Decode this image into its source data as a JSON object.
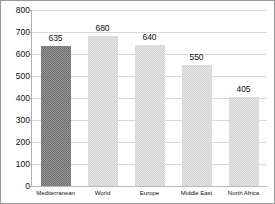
{
  "chart_data": {
    "type": "bar",
    "title": "",
    "subtitle": "",
    "xlabel": "",
    "ylabel": "",
    "categories": [
      "Mediterranean",
      "World",
      "Europe",
      "Middle East",
      "North Africa"
    ],
    "values": [
      635,
      680,
      640,
      550,
      405
    ],
    "data_labels": [
      "635",
      "680",
      "640",
      "550",
      "405"
    ],
    "ylim": [
      0,
      800
    ],
    "ytick_values": [
      800,
      700,
      600,
      500,
      400,
      300,
      200,
      100,
      0
    ],
    "ytick_labels": [
      "800",
      "700",
      "600",
      "500",
      "400",
      "300",
      "200",
      "100",
      "0"
    ],
    "grid": true,
    "grid_axis": "y",
    "legend": false,
    "legend_position": "none",
    "highlight_index": 0,
    "colors": {
      "bar_default": "#dcdcdc",
      "bar_highlight": "#808080",
      "gridline": "#d8d8d8",
      "axis": "#b0b0b0",
      "frame_border": "#9a9a9a",
      "background": "#ffffff",
      "text": "#111111"
    }
  }
}
